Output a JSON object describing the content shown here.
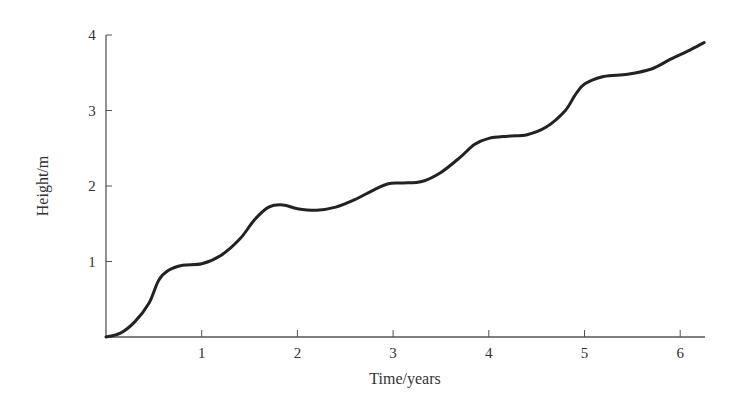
{
  "chart_data": {
    "type": "line",
    "title": "",
    "xlabel": "Time/years",
    "ylabel": "Height/m",
    "xlim": [
      0,
      6.25
    ],
    "ylim": [
      0,
      4
    ],
    "x_ticks": [
      "1",
      "2",
      "3",
      "4",
      "5",
      "6"
    ],
    "y_ticks": [
      "1",
      "2",
      "3",
      "4"
    ],
    "grid": false,
    "legend": null,
    "series": [
      {
        "name": "Height",
        "color": "#222222",
        "x": [
          0,
          0.15,
          0.3,
          0.45,
          0.55,
          0.65,
          0.8,
          1.0,
          1.2,
          1.4,
          1.55,
          1.7,
          1.85,
          2.0,
          2.2,
          2.4,
          2.6,
          2.8,
          2.95,
          3.1,
          3.3,
          3.5,
          3.7,
          3.85,
          4.0,
          4.2,
          4.4,
          4.6,
          4.8,
          4.9,
          5.0,
          5.2,
          5.45,
          5.7,
          5.9,
          6.1,
          6.25
        ],
        "y": [
          0,
          0.05,
          0.2,
          0.45,
          0.75,
          0.88,
          0.95,
          0.97,
          1.08,
          1.3,
          1.55,
          1.72,
          1.75,
          1.7,
          1.68,
          1.72,
          1.82,
          1.95,
          2.03,
          2.04,
          2.06,
          2.18,
          2.38,
          2.55,
          2.63,
          2.66,
          2.68,
          2.78,
          3.0,
          3.2,
          3.35,
          3.45,
          3.48,
          3.55,
          3.68,
          3.8,
          3.9
        ]
      }
    ]
  }
}
